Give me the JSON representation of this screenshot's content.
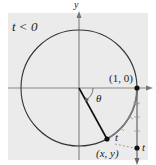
{
  "figure": {
    "condition_label": "t < 0",
    "y_axis_label": "y",
    "angle_label": "θ",
    "point_on_axis_label": "(1, 0)",
    "point_on_circle_label": "(x, y)",
    "arc_label": "t",
    "number_line_label": "t",
    "colors": {
      "background": "#ebebeb",
      "curve": "#333333",
      "axis": "#777777",
      "radius": "#111111",
      "wrap_arc": "#777777"
    }
  }
}
